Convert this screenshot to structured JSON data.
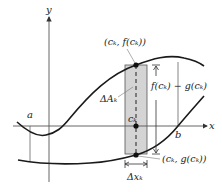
{
  "figure": {
    "axes": {
      "x_label": "x",
      "y_label": "y"
    },
    "bounds": {
      "a_label": "a",
      "b_label": "b"
    },
    "labels": {
      "upper_point": "(cₖ, f(cₖ))",
      "lower_point": "(cₖ, g(cₖ))",
      "sample_point": "cₖ",
      "height": "f(cₖ) − g(cₖ)",
      "area_element": "ΔAₖ",
      "width": "Δxₖ"
    },
    "colors": {
      "strip_fill": "#d4d4d4",
      "curve": "#1a1a1a",
      "axis": "#555555"
    }
  }
}
